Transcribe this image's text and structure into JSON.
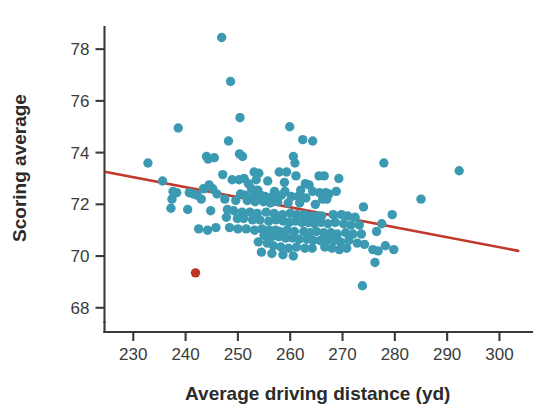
{
  "chart_data": {
    "type": "scatter",
    "title": "",
    "xlabel": "Average driving distance (yd)",
    "ylabel": "Scoring average",
    "xlim": [
      224.5,
      304.5
    ],
    "ylim": [
      67.45,
      79.05
    ],
    "xticks": [
      230,
      240,
      250,
      260,
      270,
      280,
      290,
      300
    ],
    "yticks": [
      68,
      70,
      72,
      74,
      76,
      78
    ],
    "xtick_labels": [
      "230",
      "240",
      "250",
      "260",
      "270",
      "280",
      "290",
      "300"
    ],
    "ytick_labels": [
      "68",
      "70",
      "72",
      "74",
      "76",
      "78"
    ],
    "grid": false,
    "legend": null,
    "colors": {
      "points": "#3b9ab2",
      "highlight_point": "#bf3525",
      "trend_line": "#c0392b",
      "axis": "#3a3a3a",
      "text": "#2b2b2b"
    },
    "point_radius": 4.7,
    "series": [
      {
        "name": "PGA players",
        "marker_color": "#3b9ab2",
        "points": [
          [
            246.9,
            78.45
          ],
          [
            248.6,
            76.75
          ],
          [
            250.4,
            75.35
          ],
          [
            238.6,
            74.95
          ],
          [
            259.9,
            75.0
          ],
          [
            248.2,
            74.45
          ],
          [
            262.4,
            74.5
          ],
          [
            264.3,
            74.45
          ],
          [
            250.3,
            73.95
          ],
          [
            250.9,
            73.85
          ],
          [
            244.0,
            73.85
          ],
          [
            245.5,
            73.8
          ],
          [
            244.3,
            73.75
          ],
          [
            260.6,
            73.85
          ],
          [
            260.9,
            73.6
          ],
          [
            232.8,
            73.6
          ],
          [
            277.9,
            73.6
          ],
          [
            292.3,
            73.3
          ],
          [
            247.1,
            73.15
          ],
          [
            253.1,
            73.25
          ],
          [
            254.0,
            73.2
          ],
          [
            257.9,
            73.25
          ],
          [
            259.3,
            73.25
          ],
          [
            261.1,
            73.1
          ],
          [
            265.5,
            73.1
          ],
          [
            266.5,
            73.1
          ],
          [
            269.3,
            73.0
          ],
          [
            251.2,
            73.0
          ],
          [
            235.6,
            72.9
          ],
          [
            248.9,
            72.95
          ],
          [
            250.2,
            72.95
          ],
          [
            253.5,
            72.95
          ],
          [
            255.7,
            72.9
          ],
          [
            258.9,
            72.85
          ],
          [
            262.9,
            72.8
          ],
          [
            263.6,
            72.75
          ],
          [
            252.0,
            72.8
          ],
          [
            244.5,
            72.75
          ],
          [
            245.2,
            72.6
          ],
          [
            243.4,
            72.6
          ],
          [
            252.6,
            72.6
          ],
          [
            253.8,
            72.55
          ],
          [
            257.0,
            72.5
          ],
          [
            259.0,
            72.5
          ],
          [
            262.0,
            72.55
          ],
          [
            264.3,
            72.5
          ],
          [
            265.6,
            72.45
          ],
          [
            266.8,
            72.45
          ],
          [
            267.4,
            72.4
          ],
          [
            268.8,
            72.5
          ],
          [
            237.6,
            72.5
          ],
          [
            238.3,
            72.45
          ],
          [
            240.7,
            72.45
          ],
          [
            241.5,
            72.4
          ],
          [
            242.2,
            72.35
          ],
          [
            246.0,
            72.4
          ],
          [
            250.5,
            72.4
          ],
          [
            251.4,
            72.35
          ],
          [
            253.0,
            72.3
          ],
          [
            254.4,
            72.35
          ],
          [
            255.2,
            72.3
          ],
          [
            256.6,
            72.3
          ],
          [
            258.3,
            72.35
          ],
          [
            260.2,
            72.3
          ],
          [
            261.5,
            72.3
          ],
          [
            263.0,
            72.25
          ],
          [
            266.2,
            72.2
          ],
          [
            267.0,
            72.2
          ],
          [
            285.0,
            72.2
          ],
          [
            237.4,
            72.2
          ],
          [
            243.0,
            72.2
          ],
          [
            247.5,
            72.2
          ],
          [
            249.6,
            72.15
          ],
          [
            251.8,
            72.15
          ],
          [
            253.3,
            72.1
          ],
          [
            254.9,
            72.1
          ],
          [
            256.2,
            72.05
          ],
          [
            257.6,
            72.1
          ],
          [
            259.6,
            72.05
          ],
          [
            261.8,
            72.05
          ],
          [
            264.8,
            72.0
          ],
          [
            274.0,
            71.9
          ],
          [
            237.2,
            71.85
          ],
          [
            240.4,
            71.8
          ],
          [
            244.8,
            71.75
          ],
          [
            248.0,
            71.8
          ],
          [
            249.2,
            71.75
          ],
          [
            250.8,
            71.7
          ],
          [
            252.3,
            71.7
          ],
          [
            253.7,
            71.65
          ],
          [
            255.4,
            71.7
          ],
          [
            256.9,
            71.65
          ],
          [
            258.5,
            71.6
          ],
          [
            260.0,
            71.65
          ],
          [
            261.3,
            71.6
          ],
          [
            262.7,
            71.6
          ],
          [
            264.0,
            71.55
          ],
          [
            265.2,
            71.55
          ],
          [
            266.0,
            71.55
          ],
          [
            268.2,
            71.6
          ],
          [
            269.8,
            71.6
          ],
          [
            271.0,
            71.55
          ],
          [
            272.4,
            71.5
          ],
          [
            279.5,
            71.6
          ],
          [
            247.8,
            71.5
          ],
          [
            249.9,
            71.45
          ],
          [
            251.1,
            71.45
          ],
          [
            252.8,
            71.4
          ],
          [
            254.2,
            71.4
          ],
          [
            255.9,
            71.35
          ],
          [
            257.3,
            71.4
          ],
          [
            258.7,
            71.35
          ],
          [
            259.8,
            71.3
          ],
          [
            261.0,
            71.35
          ],
          [
            262.2,
            71.3
          ],
          [
            263.4,
            71.3
          ],
          [
            264.6,
            71.25
          ],
          [
            265.9,
            71.3
          ],
          [
            267.2,
            71.25
          ],
          [
            268.6,
            71.3
          ],
          [
            270.2,
            71.25
          ],
          [
            271.6,
            71.2
          ],
          [
            273.2,
            71.2
          ],
          [
            277.5,
            71.25
          ],
          [
            245.8,
            71.1
          ],
          [
            248.4,
            71.1
          ],
          [
            250.0,
            71.05
          ],
          [
            251.6,
            71.05
          ],
          [
            253.2,
            71.0
          ],
          [
            254.6,
            71.05
          ],
          [
            256.0,
            71.0
          ],
          [
            257.2,
            71.0
          ],
          [
            258.0,
            70.95
          ],
          [
            259.4,
            71.0
          ],
          [
            260.8,
            70.95
          ],
          [
            262.6,
            70.95
          ],
          [
            263.8,
            70.9
          ],
          [
            265.0,
            70.95
          ],
          [
            266.4,
            70.9
          ],
          [
            267.8,
            70.9
          ],
          [
            269.0,
            70.85
          ],
          [
            270.6,
            70.9
          ],
          [
            272.0,
            70.85
          ],
          [
            273.6,
            70.85
          ],
          [
            242.5,
            71.05
          ],
          [
            244.2,
            71.0
          ],
          [
            276.5,
            70.95
          ],
          [
            255.0,
            70.8
          ],
          [
            256.4,
            70.75
          ],
          [
            257.8,
            70.75
          ],
          [
            259.1,
            70.7
          ],
          [
            260.4,
            70.7
          ],
          [
            261.7,
            70.65
          ],
          [
            263.2,
            70.65
          ],
          [
            264.4,
            70.6
          ],
          [
            265.7,
            70.6
          ],
          [
            267.0,
            70.6
          ],
          [
            268.4,
            70.6
          ],
          [
            269.6,
            70.55
          ],
          [
            271.2,
            70.6
          ],
          [
            272.8,
            70.5
          ],
          [
            274.2,
            70.45
          ],
          [
            278.2,
            70.4
          ],
          [
            279.8,
            70.25
          ],
          [
            253.9,
            70.55
          ],
          [
            255.6,
            70.5
          ],
          [
            256.8,
            70.4
          ],
          [
            258.2,
            70.35
          ],
          [
            259.7,
            70.3
          ],
          [
            261.2,
            70.35
          ],
          [
            262.8,
            70.3
          ],
          [
            264.2,
            70.3
          ],
          [
            266.6,
            70.35
          ],
          [
            268.0,
            70.3
          ],
          [
            269.4,
            70.25
          ],
          [
            270.8,
            70.3
          ],
          [
            275.8,
            70.25
          ],
          [
            276.8,
            70.2
          ],
          [
            254.5,
            70.15
          ],
          [
            256.5,
            70.1
          ],
          [
            258.6,
            70.05
          ],
          [
            260.6,
            70.0
          ],
          [
            276.2,
            69.75
          ],
          [
            273.8,
            68.85
          ]
        ]
      },
      {
        "name": "Highlighted player",
        "marker_color": "#bf3525",
        "points": [
          [
            241.9,
            69.35
          ]
        ]
      }
    ],
    "trend_line": {
      "color": "#c0392b",
      "x_start": 224.8,
      "y_start": 73.25,
      "x_end": 303.6,
      "y_end": 70.2,
      "slope": -0.0387,
      "intercept": 81.95
    }
  }
}
